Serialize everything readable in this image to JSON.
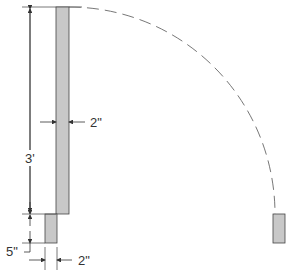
{
  "diagram": {
    "type": "door-swing-dimension-drawing",
    "colors": {
      "line": "#333333",
      "fill": "#c8c8c8",
      "arc": "#777777"
    },
    "labels": {
      "door_height": "3'",
      "door_thickness": "2\"",
      "stop_height": "5\"",
      "stop_thickness": "2\""
    },
    "shapes": {
      "door_panel": "tall rectangle (door leaf)",
      "door_stop_left": "small rectangle below door",
      "door_stop_right": "small rectangle at end of swing",
      "swing_arc": "dashed quarter-circle"
    }
  }
}
